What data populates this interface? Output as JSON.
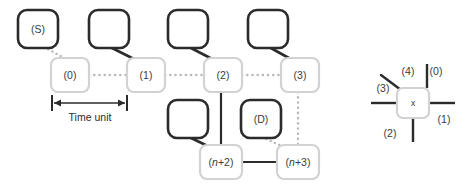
{
  "diagram": {
    "colors": {
      "dark_stroke": "#2b2b2b",
      "light_stroke": "#d2d2d2",
      "dotted_gray": "#b9b9b9",
      "text": "#3a3a3a",
      "background": "#ffffff"
    },
    "dark_nodes": [
      {
        "id": "dark-s",
        "label": "(S)",
        "x": 18,
        "y": 10,
        "w": 40,
        "h": 38
      },
      {
        "id": "dark-empty-1",
        "label": "",
        "x": 89,
        "y": 10,
        "w": 40,
        "h": 38
      },
      {
        "id": "dark-empty-2",
        "label": "",
        "x": 168,
        "y": 10,
        "w": 40,
        "h": 38
      },
      {
        "id": "dark-empty-3",
        "label": "",
        "x": 248,
        "y": 10,
        "w": 40,
        "h": 38
      },
      {
        "id": "dark-empty-4",
        "label": "",
        "x": 168,
        "y": 100,
        "w": 40,
        "h": 38
      },
      {
        "id": "dark-d",
        "label": "(D)",
        "x": 241,
        "y": 100,
        "w": 40,
        "h": 38
      }
    ],
    "slot_nodes": [
      {
        "id": "slot-0",
        "label": "(0)",
        "x": 51,
        "y": 58,
        "w": 38,
        "h": 34
      },
      {
        "id": "slot-1",
        "label": "(1)",
        "x": 127,
        "y": 58,
        "w": 38,
        "h": 34
      },
      {
        "id": "slot-2",
        "label": "(2)",
        "x": 204,
        "y": 58,
        "w": 38,
        "h": 34
      },
      {
        "id": "slot-3",
        "label": "(3)",
        "x": 281,
        "y": 58,
        "w": 38,
        "h": 34
      },
      {
        "id": "slot-n2",
        "label": "(n+2)",
        "label_prefix": "(",
        "label_italic": "n",
        "label_suffix": "+2)",
        "x": 200,
        "y": 145,
        "w": 42,
        "h": 34
      },
      {
        "id": "slot-n3",
        "label": "(n+3)",
        "label_prefix": "(",
        "label_italic": "n",
        "label_suffix": "+3)",
        "x": 277,
        "y": 145,
        "w": 42,
        "h": 34
      }
    ],
    "ruler": {
      "label": "Time unit",
      "x1": 52,
      "x2": 127,
      "y": 102,
      "label_y": 117
    },
    "legend": {
      "core_label": "x",
      "box": {
        "x": 397,
        "y": 88,
        "w": 32,
        "h": 30
      },
      "ports": [
        {
          "name": "0",
          "label": "(0)",
          "label_x": 436,
          "label_y": 72
        },
        {
          "name": "1",
          "label": "(1)",
          "label_x": 444,
          "label_y": 120
        },
        {
          "name": "2",
          "label": "(2)",
          "label_x": 390,
          "label_y": 134
        },
        {
          "name": "3",
          "label": "(3)",
          "label_x": 383,
          "label_y": 89
        },
        {
          "name": "4",
          "label": "(4)",
          "label_x": 408,
          "label_y": 72
        }
      ]
    }
  }
}
